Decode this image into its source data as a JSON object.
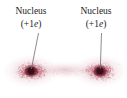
{
  "figure": {
    "background_color": "#ffffff",
    "width": 127,
    "height": 98
  },
  "labels": {
    "left": {
      "line1": "Nucleus",
      "line2_open": "(+1",
      "line2_symbol": "e",
      "line2_close": ")"
    },
    "right": {
      "line1": "Nucleus",
      "line2_open": "(+1",
      "line2_symbol": "e",
      "line2_close": ")"
    }
  },
  "leader_lines": [
    {
      "name": "left-leader",
      "x1": 38.5,
      "y1": 33,
      "x2": 31,
      "y2": 69
    },
    {
      "name": "right-leader",
      "x1": 101.5,
      "y1": 33,
      "x2": 100,
      "y2": 69
    }
  ],
  "nuclei": [
    {
      "name": "left-nucleus",
      "cx": 31,
      "cy": 71,
      "r": 3.4,
      "color": "#3a1118"
    },
    {
      "name": "right-nucleus",
      "cx": 100,
      "cy": 71,
      "r": 3.4,
      "color": "#3a1118"
    }
  ],
  "electron_cloud": {
    "name": "electron-cloud",
    "dot_color_dark": "#8e2d3f",
    "dot_color_mid": "#c06a7c",
    "dot_color_light": "#e3b0bc",
    "center_y": 71,
    "left_center_x": 31,
    "right_center_x": 100,
    "x_extent": [
      2,
      125
    ],
    "y_extent": [
      52,
      94
    ],
    "dot_count": 2600
  },
  "colors": {
    "text": "#1b1b1b",
    "leader": "#6e6e78",
    "nucleus": "#3a1118",
    "cloud_accent": "#b5556a",
    "background": "#ffffff"
  }
}
